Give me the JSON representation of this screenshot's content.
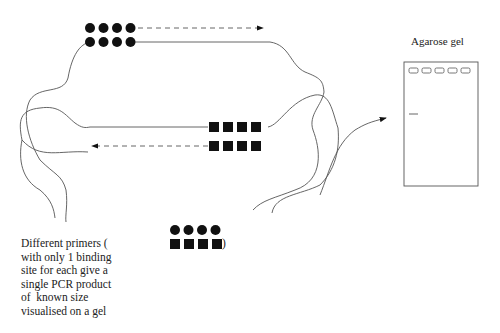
{
  "gel": {
    "title": "Agarose gel",
    "lanes": 5,
    "bands": [
      {
        "lane": 1,
        "label": "single PCR product"
      }
    ]
  },
  "primers": {
    "forward": {
      "shape": "circle",
      "count": 4,
      "direction": "right"
    },
    "reverse": {
      "shape": "square",
      "count": 4,
      "direction": "left"
    }
  },
  "caption": {
    "lines": [
      "Different primers (",
      "with only 1 binding",
      "site for each give a",
      "single PCR product",
      "of  known size",
      "visualised on a gel"
    ],
    "close_paren": ")"
  },
  "colors": {
    "line": "#555555",
    "primer": "#111111",
    "text": "#222222"
  }
}
